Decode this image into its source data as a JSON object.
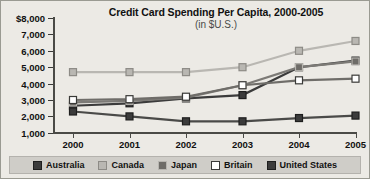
{
  "chart_data": {
    "type": "line",
    "title": "Credit Card Spending Per Capita, 2000-2005",
    "subtitle": "(in $U.S.)",
    "xlabel": "",
    "ylabel": "",
    "categories": [
      "2000",
      "2001",
      "2002",
      "2003",
      "2004",
      "2005"
    ],
    "x": [
      2000,
      2001,
      2002,
      2003,
      2004,
      2005
    ],
    "ylim": [
      0,
      8000
    ],
    "xlim": [
      2000,
      2005
    ],
    "ytick_labels": [
      "$8,000",
      "7,000",
      "6,000",
      "5,000",
      "4,000",
      "3,000",
      "2,000",
      "1,000"
    ],
    "ytick_values": [
      8000,
      7000,
      6000,
      5000,
      4000,
      3000,
      2000,
      1000
    ],
    "grid": false,
    "legend_position": "bottom",
    "marker": "square",
    "series": [
      {
        "name": "Australia",
        "color": "#3b3b3b",
        "marker_fill": "#3b3b3b",
        "marker_edge": "#1e1e1e",
        "values": [
          2650,
          2800,
          3100,
          3300,
          5000,
          5400
        ]
      },
      {
        "name": "Canada",
        "color": "#b9b7b2",
        "marker_fill": "#b9b7b2",
        "marker_edge": "#8d8b86",
        "values": [
          4700,
          4700,
          4700,
          5000,
          6000,
          6600
        ]
      },
      {
        "name": "Japan",
        "color": "#7c7a76",
        "marker_fill": "#6e6c68",
        "marker_edge": "#b7b5b0",
        "values": [
          2850,
          2950,
          3150,
          3900,
          5000,
          5350
        ]
      },
      {
        "name": "Britain",
        "color": "#6f6d69",
        "marker_fill": "#ffffff",
        "marker_edge": "#3a3a38",
        "values": [
          3000,
          3050,
          3200,
          3900,
          4200,
          4300
        ]
      },
      {
        "name": "United States",
        "color": "#4a4a48",
        "marker_fill": "#3b3b3b",
        "marker_edge": "#1e1e1e",
        "values": [
          2300,
          2000,
          1700,
          1700,
          1900,
          2050
        ]
      }
    ]
  }
}
